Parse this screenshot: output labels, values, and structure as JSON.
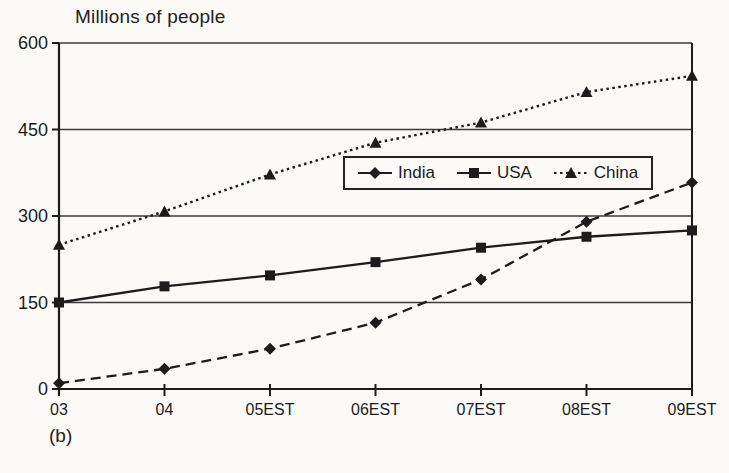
{
  "chart_data": {
    "type": "line",
    "title": "Millions of people",
    "figure_label": "(b)",
    "categories": [
      "03",
      "04",
      "05EST",
      "06EST",
      "07EST",
      "08EST",
      "09EST"
    ],
    "series": [
      {
        "name": "India",
        "marker": "diamond",
        "line": "dashed",
        "values": [
          10,
          35,
          70,
          115,
          190,
          290,
          358
        ]
      },
      {
        "name": "USA",
        "marker": "square",
        "line": "solid",
        "values": [
          150,
          178,
          197,
          220,
          245,
          264,
          275
        ]
      },
      {
        "name": "China",
        "marker": "triangle",
        "line": "dotted",
        "values": [
          250,
          308,
          372,
          427,
          462,
          515,
          543
        ]
      }
    ],
    "ylim": [
      0,
      600
    ],
    "yticks": [
      0,
      150,
      300,
      450,
      600
    ],
    "xlabel": "",
    "ylabel": "Millions of people",
    "grid": "horizontal",
    "legend_position": "inside-top-center",
    "line_color": "#1c1c1c",
    "grid_color": "#3a3a3a",
    "background_color": "#fbfaf7"
  }
}
